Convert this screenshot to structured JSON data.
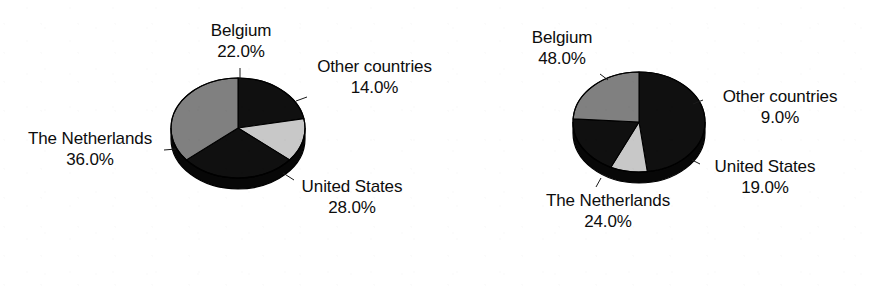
{
  "figure": {
    "background_color": "#ffffff",
    "text_color": "#0d0d0d"
  },
  "palette": {
    "black": "#101010",
    "mid_gray": "#808080",
    "light_gray": "#c8c8c8",
    "edge": "#000000",
    "side_shadow": "#070707"
  },
  "charts": [
    {
      "id": "chart-left",
      "center_x": 238,
      "center_y": 128,
      "radius_x": 67,
      "radius_y": 50,
      "depth": 11,
      "start_angle": -90,
      "labels": [
        {
          "name": "Belgium",
          "value": "22.0%",
          "x": 182,
          "y": 20,
          "width": 118,
          "leader": {
            "x1": 240,
            "y1": 68,
            "x2": 240,
            "y2": 80
          }
        },
        {
          "name": "Other countries",
          "value": "14.0%",
          "x": 297,
          "y": 56,
          "width": 155,
          "leader": {
            "x1": 296,
            "y1": 101,
            "x2": 307,
            "y2": 97
          }
        },
        {
          "name": "The Netherlands",
          "value": "36.0%",
          "x": 2,
          "y": 128,
          "width": 176,
          "leader": {
            "x1": 164,
            "y1": 150,
            "x2": 176,
            "y2": 149
          }
        },
        {
          "name": "United States",
          "value": "28.0%",
          "x": 277,
          "y": 176,
          "width": 150,
          "leader": {
            "x1": 283,
            "y1": 173,
            "x2": 294,
            "y2": 180
          }
        }
      ]
    },
    {
      "id": "chart-right",
      "center_x": 639,
      "center_y": 122,
      "radius_x": 66,
      "radius_y": 50,
      "depth": 11,
      "start_angle": -90,
      "labels": [
        {
          "name": "Belgium",
          "value": "48.0%",
          "x": 503,
          "y": 27,
          "width": 118,
          "leader": {
            "x1": 600,
            "y1": 74,
            "x2": 608,
            "y2": 80
          }
        },
        {
          "name": "Other countries",
          "value": "9.0%",
          "x": 701,
          "y": 86,
          "width": 158,
          "leader": {
            "x1": 693,
            "y1": 104,
            "x2": 703,
            "y2": 100
          }
        },
        {
          "name": "United States",
          "value": "19.0%",
          "x": 690,
          "y": 156,
          "width": 150,
          "leader": {
            "x1": 692,
            "y1": 160,
            "x2": 700,
            "y2": 164
          }
        },
        {
          "name": "The Netherlands",
          "value": "24.0%",
          "x": 520,
          "y": 190,
          "width": 176,
          "leader": {
            "x1": 601,
            "y1": 178,
            "x2": 596,
            "y2": 187
          }
        }
      ]
    }
  ],
  "chart_data": [
    {
      "type": "pie",
      "title": "",
      "subtitle": "",
      "id": "chart-left",
      "categories": [
        "Belgium",
        "Other countries",
        "United States",
        "The Netherlands"
      ],
      "values": [
        22.0,
        14.0,
        28.0,
        36.0
      ],
      "value_suffix": "%",
      "slice_colors": [
        "#101010",
        "#c8c8c8",
        "#101010",
        "#808080"
      ],
      "labels": [
        "Belgium 22.0%",
        "Other countries 14.0%",
        "United States 28.0%",
        "The Netherlands 36.0%"
      ],
      "start_angle": -90,
      "direction": "clockwise",
      "three_d": true,
      "legend": "none",
      "grid": false,
      "xlabel": "",
      "ylabel": ""
    },
    {
      "type": "pie",
      "title": "",
      "subtitle": "",
      "id": "chart-right",
      "categories": [
        "Belgium",
        "Other countries",
        "United States",
        "The Netherlands"
      ],
      "values": [
        48.0,
        9.0,
        19.0,
        24.0
      ],
      "value_suffix": "%",
      "slice_colors": [
        "#101010",
        "#c8c8c8",
        "#101010",
        "#808080"
      ],
      "labels": [
        "Belgium 48.0%",
        "Other countries 9.0%",
        "United States 19.0%",
        "The Netherlands 24.0%"
      ],
      "start_angle": -90,
      "direction": "clockwise",
      "three_d": true,
      "legend": "none",
      "grid": false,
      "xlabel": "",
      "ylabel": ""
    }
  ]
}
